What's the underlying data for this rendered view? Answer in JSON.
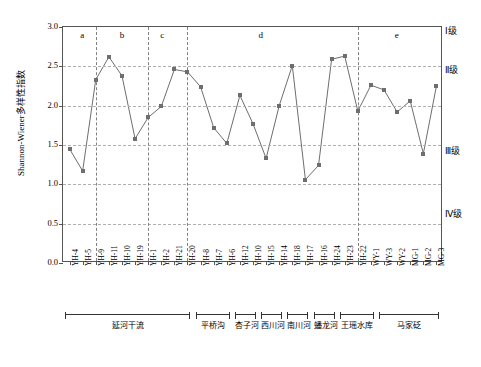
{
  "chart_data": {
    "type": "line",
    "title": "",
    "xlabel": "",
    "ylabel": "Shannon-Wiener多样性指数",
    "ylim": [
      0.0,
      3.0
    ],
    "yticks": [
      "0.0",
      "0.5",
      "1.0",
      "1.5",
      "2.0",
      "2.5",
      "3.0"
    ],
    "grid": true,
    "legend": "none",
    "categories": [
      "YH-4",
      "YH-5",
      "YH-9",
      "YH-11",
      "YH-10",
      "YH-19",
      "YH-1",
      "YH-2",
      "YH-21",
      "YH-20",
      "YH-8",
      "YH-7",
      "YH-6",
      "YH-12",
      "YH-10",
      "YH-15",
      "YH-14",
      "YH-18",
      "YH-17",
      "YH-16",
      "YH-24",
      "YH-23",
      "YH-22",
      "WY-1",
      "WY-3",
      "WY-2",
      "MG-1",
      "MG-2",
      "MG-3"
    ],
    "values": [
      1.45,
      1.17,
      2.33,
      2.62,
      2.38,
      1.58,
      1.85,
      1.99,
      2.46,
      2.43,
      2.24,
      1.72,
      1.52,
      2.13,
      1.77,
      1.33,
      2.0,
      2.51,
      1.06,
      1.24,
      2.59,
      2.63,
      1.93,
      2.26,
      2.2,
      1.92,
      2.06,
      1.39,
      2.25
    ],
    "class_labels": [
      {
        "label": "Ⅰ级",
        "y": 2.95
      },
      {
        "label": "Ⅱ级",
        "y": 2.45
      },
      {
        "label": "Ⅲ级",
        "y": 1.43
      },
      {
        "label": "Ⅳ级",
        "y": 0.62
      }
    ],
    "section_labels": [
      {
        "label": "a",
        "x": 1.4
      },
      {
        "label": "b",
        "x": 4.4
      },
      {
        "label": "c",
        "x": 7.5
      },
      {
        "label": "d",
        "x": 15.0
      },
      {
        "label": "e",
        "x": 25.4
      }
    ],
    "section_dividers": [
      2.55,
      6.5,
      9.5,
      22.5
    ],
    "groups": [
      {
        "name": "延河干流",
        "start": 0,
        "end": 9
      },
      {
        "name": "平桥沟",
        "start": 10,
        "end": 12
      },
      {
        "name": "杏子河",
        "start": 13,
        "end": 14
      },
      {
        "name": "西川河",
        "start": 15,
        "end": 16
      },
      {
        "name": "南川河",
        "start": 17,
        "end": 18
      },
      {
        "name": "蟠龙河",
        "start": 19,
        "end": 20
      },
      {
        "name": "王瑶水库",
        "start": 21,
        "end": 23
      },
      {
        "name": "马家砭",
        "start": 24,
        "end": 28
      }
    ]
  }
}
